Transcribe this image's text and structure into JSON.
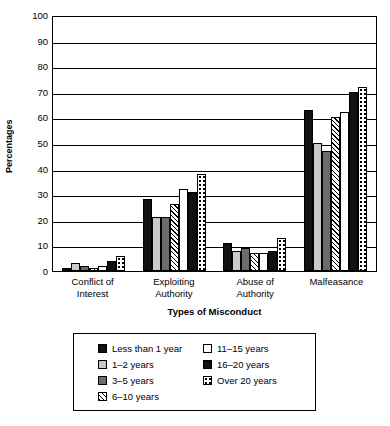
{
  "chart_data": {
    "type": "bar",
    "title": "",
    "xlabel": "Types of Misconduct",
    "ylabel": "Percentages",
    "ylim": [
      0,
      100
    ],
    "ytick_step": 10,
    "yticks": [
      "100",
      "90",
      "80",
      "70",
      "60",
      "50",
      "40",
      "30",
      "20",
      "10",
      "0"
    ],
    "grid": true,
    "legend_position": "bottom",
    "categories": [
      "Conflict of\nInterest",
      "Exploiting\nAuthority",
      "Abuse of\nAuthority",
      "Malfeasance"
    ],
    "category_lines": [
      [
        "Conflict of",
        "Interest"
      ],
      [
        "Exploiting",
        "Authority"
      ],
      [
        "Abuse of",
        "Authority"
      ],
      [
        "Malfeasance",
        ""
      ]
    ],
    "series": [
      {
        "name": "Less than 1 year",
        "pattern": "solid-black",
        "values": [
          1,
          28,
          11,
          63
        ]
      },
      {
        "name": "1–2 years",
        "pattern": "light-gray",
        "values": [
          3,
          21,
          8,
          50
        ]
      },
      {
        "name": "3–5 years",
        "pattern": "dark-gray",
        "values": [
          2,
          21,
          9,
          47
        ]
      },
      {
        "name": "6–10 years",
        "pattern": "diagonal-hatch",
        "values": [
          1,
          26,
          7,
          60
        ]
      },
      {
        "name": "11–15 years",
        "pattern": "white",
        "values": [
          2,
          32,
          7,
          62
        ]
      },
      {
        "name": "16–20 years",
        "pattern": "solid-black",
        "values": [
          4,
          31,
          8,
          70
        ]
      },
      {
        "name": "Over 20 years",
        "pattern": "checkered",
        "values": [
          6,
          38,
          13,
          72
        ]
      }
    ]
  },
  "legend": {
    "columns": [
      [
        {
          "label": "Less than 1 year",
          "pattern": "solid-black"
        },
        {
          "label": "1–2 years",
          "pattern": "light-gray"
        },
        {
          "label": "3–5 years",
          "pattern": "dark-gray"
        },
        {
          "label": "6–10 years",
          "pattern": "diagonal-hatch"
        }
      ],
      [
        {
          "label": "11–15 years",
          "pattern": "white"
        },
        {
          "label": "16–20 years",
          "pattern": "solid-black"
        },
        {
          "label": "Over 20 years",
          "pattern": "checkered"
        }
      ]
    ]
  },
  "colors": {
    "axis": "#000000",
    "background": "#ffffff",
    "solid_black": "#111111",
    "light_gray": "#c9c9c9",
    "dark_gray": "#6b6b6b"
  }
}
